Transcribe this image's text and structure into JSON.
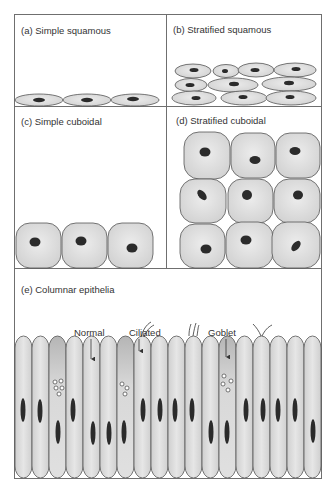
{
  "figure": {
    "panels": [
      {
        "id": "a",
        "label": "(a) Simple squamous"
      },
      {
        "id": "b",
        "label": "(b) Stratified squamous"
      },
      {
        "id": "c",
        "label": "(c) Simple cuboidal"
      },
      {
        "id": "d",
        "label": "(d) Stratified cuboidal"
      },
      {
        "id": "e",
        "label": "(e) Columnar epithelia"
      }
    ],
    "annotations": {
      "normal": "Normal",
      "ciliated": "Ciliated",
      "goblet": "Goblet"
    },
    "colors": {
      "frame": "#6f6f6f",
      "cell_fill": "#e2e2e2",
      "cell_stroke": "#555555",
      "nucleus": "#2b2b2b",
      "goblet_fill": "#bdbdbd",
      "vesicle": "#ffffff"
    }
  }
}
